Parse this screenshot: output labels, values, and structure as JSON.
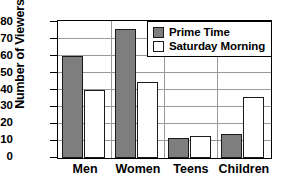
{
  "chart_data": {
    "type": "bar",
    "title": "",
    "xlabel": "",
    "ylabel": "Number of Viewers",
    "categories": [
      "Men",
      "Women",
      "Teens",
      "Children"
    ],
    "series": [
      {
        "name": "Prime Time",
        "values": [
          60,
          76,
          12,
          14
        ],
        "color": "#7e7e7e"
      },
      {
        "name": "Saturday Morning",
        "values": [
          40,
          45,
          13,
          36
        ],
        "color": "#ffffff"
      }
    ],
    "ylim": [
      0,
      80
    ],
    "ytick_step": 10,
    "yticks": [
      "80",
      "70",
      "60",
      "50",
      "40",
      "30",
      "20",
      "10",
      "0"
    ],
    "grid": true,
    "legend_position": "top-right"
  },
  "legend": {
    "items": [
      {
        "label": "Prime Time",
        "swatch": "filled-gray-swatch"
      },
      {
        "label": "Saturday Morning",
        "swatch": "empty-white-swatch"
      }
    ]
  }
}
